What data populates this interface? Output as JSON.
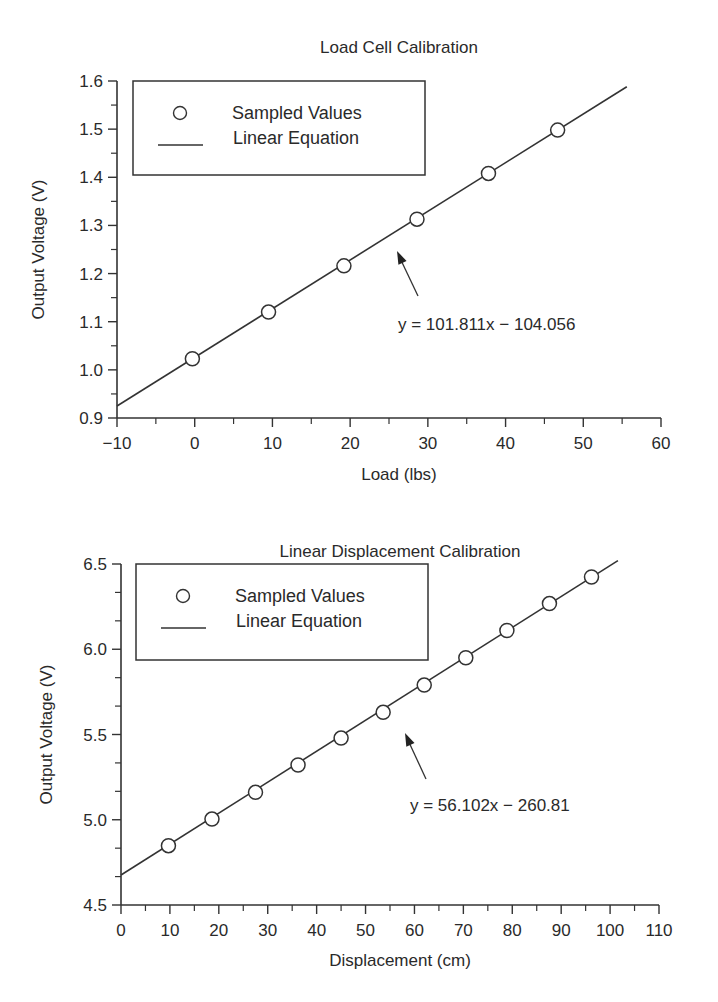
{
  "chart_data": [
    {
      "type": "scatter",
      "title": "Load Cell Calibration",
      "xlabel": "Load (lbs)",
      "ylabel": "Output Voltage (V)",
      "xlim": [
        -10,
        60
      ],
      "ylim": [
        0.9,
        1.6
      ],
      "xticks": [
        -10,
        0,
        10,
        20,
        30,
        40,
        50,
        60
      ],
      "xtick_labels": [
        "−10",
        "0",
        "10",
        "20",
        "30",
        "40",
        "50",
        "60"
      ],
      "yticks": [
        0.9,
        1.0,
        1.1,
        1.2,
        1.3,
        1.4,
        1.5,
        1.6
      ],
      "ytick_labels": [
        "0.9",
        "1.0",
        "1.1",
        "1.2",
        "1.3",
        "1.4",
        "1.5",
        "1.6"
      ],
      "grid": false,
      "legend": {
        "position": "upper-left",
        "entries": [
          "Sampled Values",
          "Linear Equation"
        ]
      },
      "annotation": "y = 101.811x − 104.056",
      "series": [
        {
          "name": "Sampled Values",
          "marker": "open-circle",
          "x": [
            -0.3,
            9.5,
            19.2,
            28.6,
            37.8,
            46.7
          ],
          "y": [
            1.023,
            1.12,
            1.216,
            1.313,
            1.408,
            1.498
          ]
        },
        {
          "name": "Linear Equation",
          "style": "line",
          "x": [
            -10,
            55.6
          ],
          "y": [
            0.925,
            1.588
          ]
        }
      ]
    },
    {
      "type": "scatter",
      "title": "Linear Displacement Calibration",
      "xlabel": "Displacement (cm)",
      "ylabel": "Output Voltage (V)",
      "xlim": [
        0,
        110
      ],
      "ylim": [
        4.5,
        6.5
      ],
      "xticks": [
        0,
        10,
        20,
        30,
        40,
        50,
        60,
        70,
        80,
        90,
        100,
        110
      ],
      "xtick_labels": [
        "0",
        "10",
        "20",
        "30",
        "40",
        "50",
        "60",
        "70",
        "80",
        "90",
        "100",
        "110"
      ],
      "yticks": [
        4.5,
        5.0,
        5.5,
        6.0,
        6.5
      ],
      "ytick_labels": [
        "4.5",
        "5.0",
        "5.5",
        "6.0",
        "6.5"
      ],
      "grid": false,
      "legend": {
        "position": "upper-left",
        "entries": [
          "Sampled Values",
          "Linear Equation"
        ]
      },
      "annotation": "y = 56.102x − 260.81",
      "series": [
        {
          "name": "Sampled Values",
          "marker": "open-circle",
          "x": [
            9.7,
            18.6,
            27.5,
            36.2,
            45.0,
            53.6,
            62.0,
            70.5,
            78.9,
            87.6,
            96.2
          ],
          "y": [
            4.848,
            5.004,
            5.161,
            5.321,
            5.479,
            5.63,
            5.79,
            5.95,
            6.11,
            6.268,
            6.424
          ]
        },
        {
          "name": "Linear Equation",
          "style": "line",
          "x": [
            0,
            101.6
          ],
          "y": [
            4.676,
            6.52
          ]
        }
      ]
    }
  ]
}
